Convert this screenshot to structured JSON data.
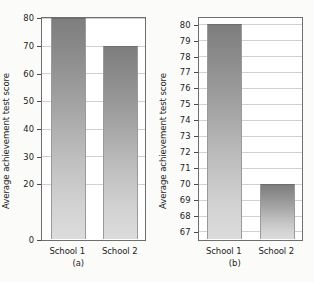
{
  "figure": {
    "background_color": "#fbfbf9",
    "bar_top_color": "#7e7e7e",
    "bar_bottom_color": "#dcdcdc",
    "grid_color": "#d0d0d0",
    "frame_color": "#6e6e6e"
  },
  "chart_data": [
    {
      "type": "bar",
      "panel_label": "(a)",
      "title": "",
      "xlabel": "",
      "ylabel": "Average achievement test score",
      "categories": [
        "School 1",
        "School 2"
      ],
      "values": [
        80,
        70
      ],
      "ylim": [
        0,
        80
      ],
      "yticks": [
        0,
        20,
        30,
        40,
        50,
        60,
        70,
        80
      ],
      "ytick_labels": [
        "0",
        "20",
        "30",
        "40",
        "50",
        "60",
        "70",
        "80"
      ],
      "grid": true,
      "legend": "none"
    },
    {
      "type": "bar",
      "panel_label": "(b)",
      "title": "",
      "xlabel": "",
      "ylabel": "Average achievement test score",
      "categories": [
        "School 1",
        "School 2"
      ],
      "values": [
        80,
        70
      ],
      "ylim": [
        66.5,
        80.4
      ],
      "yticks": [
        67,
        68,
        69,
        70,
        71,
        72,
        73,
        74,
        75,
        76,
        77,
        78,
        79,
        80
      ],
      "ytick_labels": [
        "67",
        "68",
        "69",
        "70",
        "71",
        "72",
        "73",
        "74",
        "75",
        "76",
        "77",
        "78",
        "79",
        "80"
      ],
      "grid": true,
      "legend": "none"
    }
  ]
}
